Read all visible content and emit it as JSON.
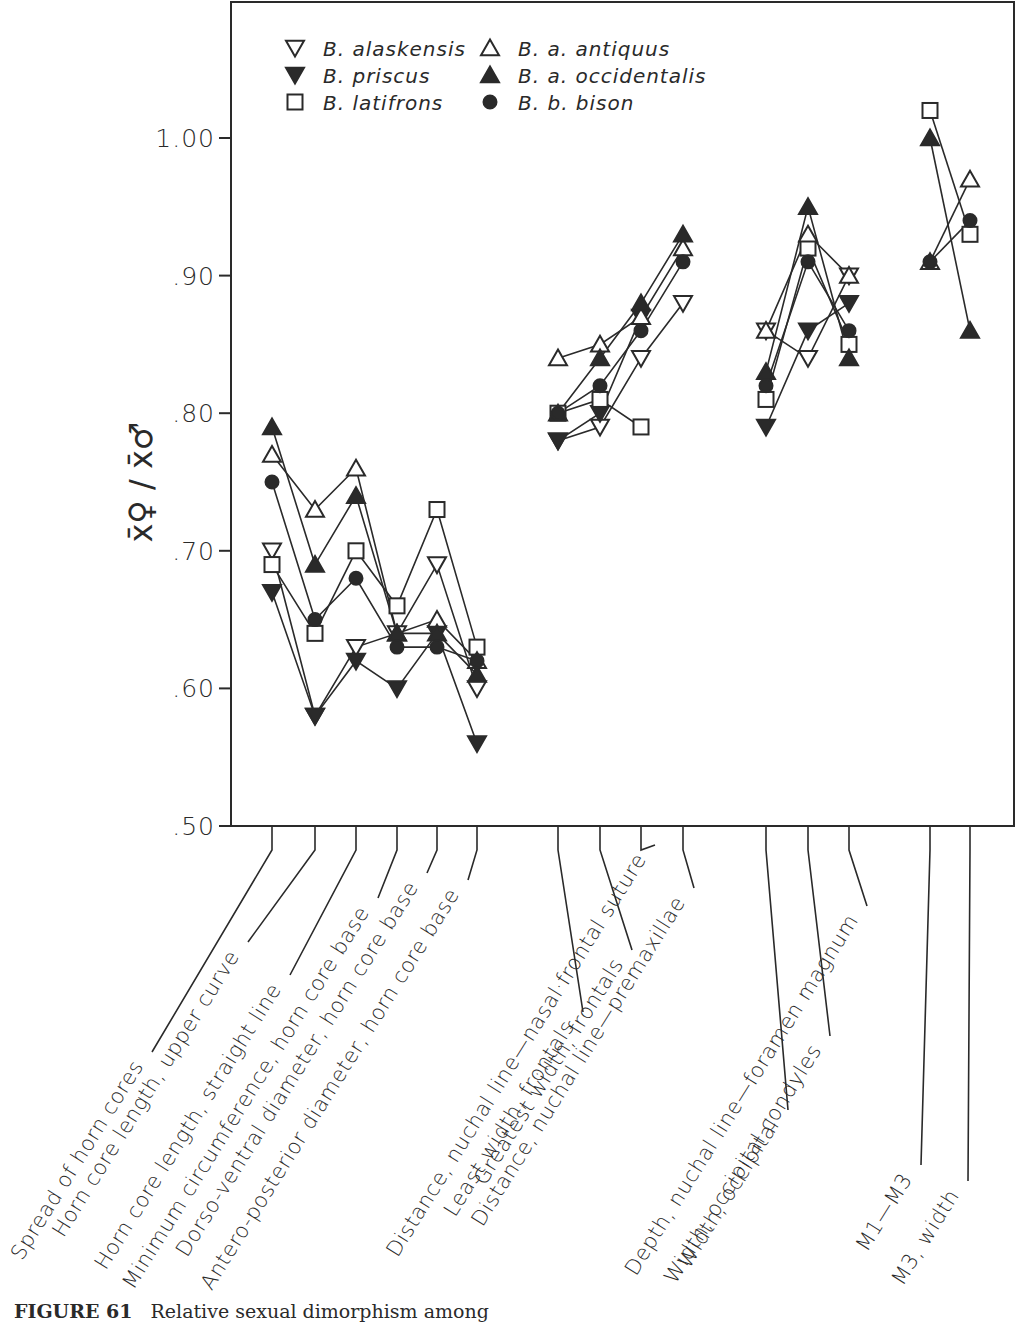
{
  "chart_data": {
    "type": "line",
    "title": "",
    "xlabel": "",
    "ylabel": "x̄♀ / x̄♂",
    "ylim": [
      0.5,
      1.0
    ],
    "yticks": [
      ".50",
      ".60",
      ".70",
      ".80",
      ".90",
      "1.00"
    ],
    "grid": false,
    "legend_position": "top-left inside",
    "categories": [
      "Spread of horn cores",
      "Horn core length, upper curve",
      "Horn core length, straight line",
      "Minimum circumference, horn core base",
      "Dorso-ventral diameter, horn core base",
      "Antero-posterior diameter, horn core base",
      "Least width, frontals",
      "Greatest width, frontals",
      "Distance, nuchal line—nasal·frontal suture",
      "Distance, nuchal line—premaxillae",
      "Width, occipital",
      "Width, occipital condyles",
      "Depth, nuchal line—foramen magnum",
      "M1—M3",
      "M3, width"
    ],
    "groups": [
      [
        0,
        1,
        2,
        3,
        4,
        5
      ],
      [
        6,
        7,
        8,
        9
      ],
      [
        10,
        11,
        12
      ],
      [
        13,
        14
      ]
    ],
    "series": [
      {
        "name": "B. alaskensis",
        "marker": "triangle-down-open",
        "values": [
          0.7,
          0.58,
          0.63,
          0.64,
          0.69,
          0.6,
          0.78,
          0.79,
          0.84,
          0.88,
          0.86,
          0.84,
          0.9,
          null,
          null
        ]
      },
      {
        "name": "B. priscus",
        "marker": "triangle-down-filled",
        "values": [
          0.67,
          0.58,
          0.62,
          0.6,
          0.64,
          0.56,
          0.78,
          0.8,
          0.87,
          null,
          0.79,
          0.86,
          0.88,
          null,
          null
        ]
      },
      {
        "name": "B. latifrons",
        "marker": "square-open",
        "values": [
          0.69,
          0.64,
          0.7,
          0.66,
          0.73,
          0.63,
          0.8,
          0.81,
          0.79,
          null,
          0.81,
          0.92,
          0.85,
          1.02,
          0.93
        ]
      },
      {
        "name": "B. a. antiquus",
        "marker": "triangle-up-open",
        "values": [
          0.77,
          0.73,
          0.76,
          0.64,
          0.65,
          0.62,
          0.84,
          0.85,
          0.87,
          0.92,
          0.86,
          0.93,
          0.9,
          0.91,
          0.97
        ]
      },
      {
        "name": "B. a. occidentalis",
        "marker": "triangle-up-filled",
        "values": [
          0.79,
          0.69,
          0.74,
          0.64,
          0.64,
          0.61,
          0.8,
          0.84,
          0.88,
          0.93,
          0.83,
          0.95,
          0.84,
          1.0,
          0.86
        ]
      },
      {
        "name": "B. b. bison",
        "marker": "circle-filled",
        "values": [
          0.75,
          0.65,
          0.68,
          0.63,
          0.63,
          0.62,
          0.8,
          0.82,
          0.86,
          0.91,
          0.82,
          0.91,
          0.86,
          0.91,
          0.94
        ]
      }
    ]
  },
  "legend": {
    "items": [
      {
        "label": "B. alaskensis",
        "marker": "triangle-down-open"
      },
      {
        "label": "B. a. antiquus",
        "marker": "triangle-up-open"
      },
      {
        "label": "B. priscus",
        "marker": "triangle-down-filled"
      },
      {
        "label": "B. a. occidentalis",
        "marker": "triangle-up-filled"
      },
      {
        "label": "B. latifrons",
        "marker": "square-open"
      },
      {
        "label": "B. b. bison",
        "marker": "circle-filled"
      }
    ]
  },
  "caption": {
    "figure_number": "FIGURE 61",
    "text": "Relative sexual dimorphism among"
  },
  "colors": {
    "ink": "#2a2a2a",
    "background": "#ffffff"
  }
}
